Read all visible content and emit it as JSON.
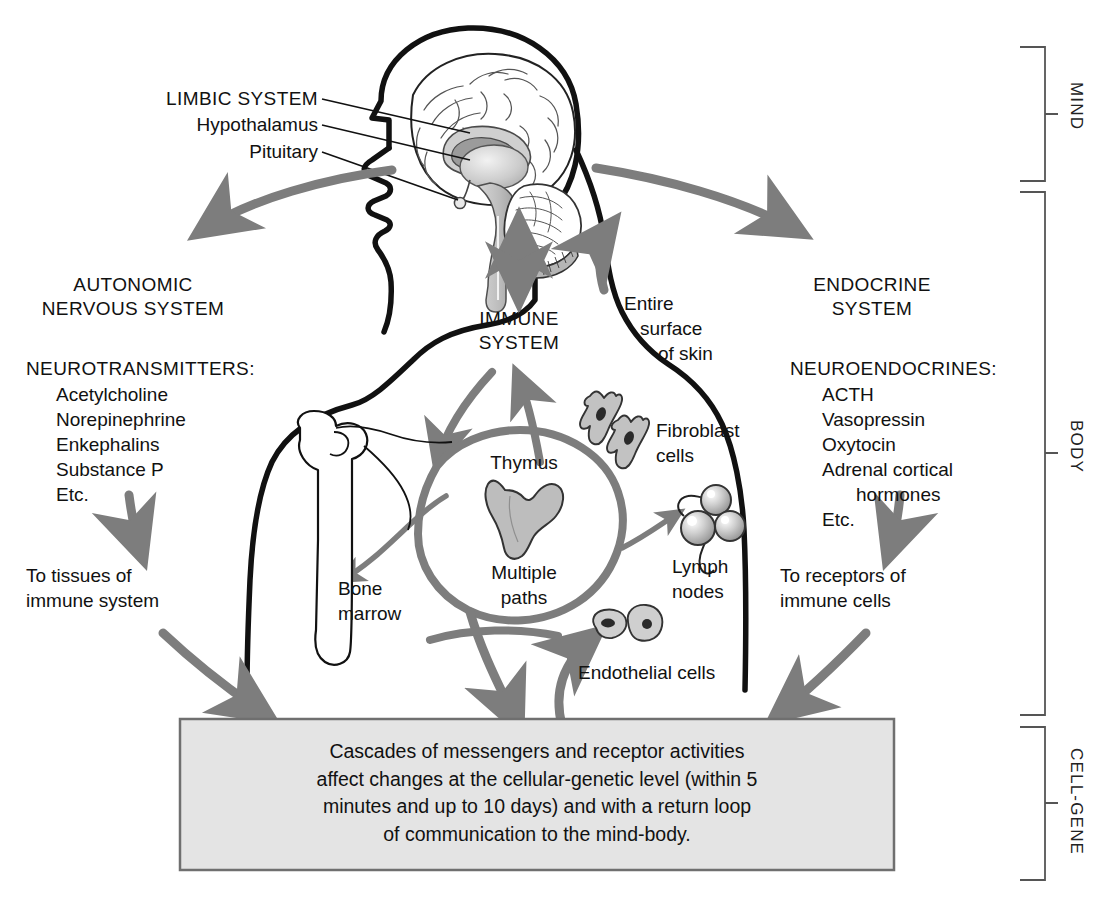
{
  "diagram": {
    "colors": {
      "outline": "#111111",
      "arrow_gray": "#7d7d7d",
      "organ_fill": "#bdbdbd",
      "box_fill": "#e4e4e4",
      "box_border": "#6f6f6f",
      "bracket": "#555555",
      "background": "#ffffff"
    },
    "brackets": [
      {
        "id": "mind",
        "label": "MIND"
      },
      {
        "id": "body",
        "label": "BODY"
      },
      {
        "id": "cell_gene",
        "label": "CELL-GENE"
      }
    ],
    "brain_callouts": [
      {
        "label": "LIMBIC SYSTEM",
        "style": "caps"
      },
      {
        "label": "Hypothalamus",
        "style": "mixed"
      },
      {
        "label": "Pituitary",
        "style": "mixed"
      }
    ],
    "left_branch": {
      "heading_line1": "AUTONOMIC",
      "heading_line2": "NERVOUS SYSTEM",
      "list_heading": "NEUROTRANSMITTERS:",
      "list_items": [
        "Acetylcholine",
        "Norepinephrine",
        "Enkephalins",
        "Substance P",
        "Etc."
      ],
      "target_line1": "To tissues of",
      "target_line2": "immune system"
    },
    "right_branch": {
      "heading_line1": "ENDOCRINE",
      "heading_line2": "SYSTEM",
      "list_heading": "NEUROENDOCRINES:",
      "list_items": [
        "ACTH",
        "Vasopressin",
        "Oxytocin",
        "Adrenal cortical",
        "hormones",
        "Etc."
      ],
      "target_line1": "To receptors of",
      "target_line2": "immune cells"
    },
    "center": {
      "heading_line1": "IMMUNE",
      "heading_line2": "SYSTEM",
      "thymus": "Thymus",
      "multiple_line1": "Multiple",
      "multiple_line2": "paths"
    },
    "organ_labels": [
      {
        "id": "skin",
        "line1": "Entire",
        "line2": "surface",
        "line3": "of skin"
      },
      {
        "id": "fibroblast",
        "line1": "Fibroblast",
        "line2": "cells"
      },
      {
        "id": "lymph",
        "line1": "Lymph",
        "line2": "nodes"
      },
      {
        "id": "bone_marrow",
        "line1": "Bone",
        "line2": "marrow"
      },
      {
        "id": "endothelial",
        "line1": "Endothelial cells"
      }
    ],
    "cell_gene_box": {
      "lines": [
        "Cascades of messengers and receptor activities",
        "affect changes at the cellular-genetic level (within 5",
        "minutes and up to 10 days) and with a return loop",
        "of communication to the mind-body."
      ]
    }
  }
}
